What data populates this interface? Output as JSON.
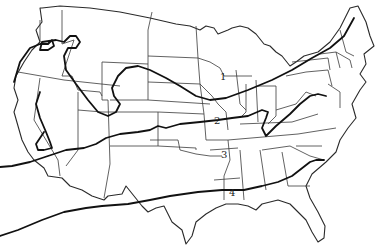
{
  "map": {
    "title": "",
    "region": "Contiguous United States",
    "style": {
      "background": "#ffffff",
      "line_color": "#111111",
      "border_color": "#3a3a3a"
    },
    "zone_labels": [
      {
        "id": "zone-1",
        "text": "1",
        "x": 220,
        "y": 80
      },
      {
        "id": "zone-2",
        "text": "2",
        "x": 216,
        "y": 124
      },
      {
        "id": "zone-3",
        "text": "3",
        "x": 225,
        "y": 158
      },
      {
        "id": "zone-4",
        "text": "4",
        "x": 231,
        "y": 196
      }
    ]
  }
}
